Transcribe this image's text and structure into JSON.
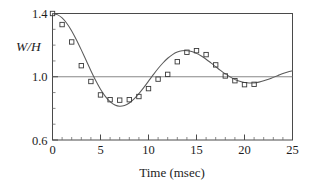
{
  "chart_data": {
    "type": "scatter",
    "title": "",
    "xlabel": "Time (msec)",
    "ylabel": "W/H",
    "xlim": [
      0,
      25
    ],
    "ylim": [
      0.6,
      1.4
    ],
    "xticks": [
      0,
      5,
      10,
      15,
      20,
      25
    ],
    "xtick_labels": [
      "0",
      "5",
      "10",
      "15",
      "20",
      "25"
    ],
    "yticks": [
      0.6,
      1.0,
      1.4
    ],
    "ytick_labels": [
      "0.6",
      "1.0",
      "1.4"
    ],
    "x_minor_tick_step": 1,
    "y_minor_tick_step": 0.1,
    "grid": "horizontal reference line at y=1.0",
    "legend": "none",
    "marker_style": "open square",
    "series": [
      {
        "name": "measured",
        "type": "scatter",
        "x": [
          0,
          1,
          2,
          3,
          4,
          5,
          6,
          7,
          8,
          9,
          10,
          11,
          12,
          13,
          14,
          15,
          16,
          17,
          18,
          19,
          20,
          21
        ],
        "y": [
          1.4,
          1.33,
          1.22,
          1.07,
          0.97,
          0.885,
          0.855,
          0.852,
          0.855,
          0.875,
          0.925,
          0.985,
          1.015,
          1.095,
          1.155,
          1.165,
          1.14,
          1.075,
          1.005,
          0.975,
          0.95,
          0.952
        ]
      },
      {
        "name": "model fit",
        "type": "line",
        "x": [
          0.0,
          0.5,
          1.0,
          1.5,
          2.0,
          2.5,
          3.0,
          3.5,
          4.0,
          4.5,
          5.0,
          5.5,
          6.0,
          6.5,
          7.0,
          7.5,
          8.0,
          8.5,
          9.0,
          9.5,
          10.0,
          10.5,
          11.0,
          11.5,
          12.0,
          12.5,
          13.0,
          13.5,
          14.0,
          14.5,
          15.0,
          15.5,
          16.0,
          16.5,
          17.0,
          17.5,
          18.0,
          18.5,
          19.0,
          19.5,
          20.0,
          20.5,
          21.0,
          21.5,
          22.0,
          22.5,
          23.0,
          23.5,
          24.0,
          24.5,
          25.0
        ],
        "y": [
          1.4,
          1.393,
          1.372,
          1.337,
          1.29,
          1.233,
          1.17,
          1.104,
          1.038,
          0.976,
          0.921,
          0.876,
          0.842,
          0.821,
          0.813,
          0.818,
          0.834,
          0.86,
          0.893,
          0.931,
          0.972,
          1.013,
          1.052,
          1.087,
          1.117,
          1.14,
          1.156,
          1.164,
          1.165,
          1.16,
          1.148,
          1.131,
          1.111,
          1.088,
          1.064,
          1.04,
          1.018,
          0.999,
          0.983,
          0.971,
          0.963,
          0.96,
          0.961,
          0.966,
          0.974,
          0.984,
          0.996,
          1.008,
          1.02,
          1.03,
          1.038
        ]
      }
    ]
  }
}
